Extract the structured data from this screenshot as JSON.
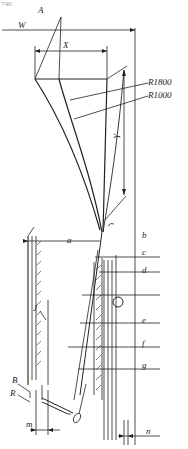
{
  "corner_text": "740",
  "labels": {
    "A": "A",
    "W": "W",
    "X": "X",
    "Y": "Y",
    "R1800": "R1800",
    "R1000": "R1000",
    "a": "a",
    "b": "b",
    "c": "c",
    "d": "d",
    "e": "e",
    "f": "f",
    "g": "g",
    "J": "J",
    "B": "B",
    "R": "R",
    "m": "m",
    "n": "n"
  },
  "colors": {
    "line": "#222222",
    "background": "#ffffff"
  }
}
